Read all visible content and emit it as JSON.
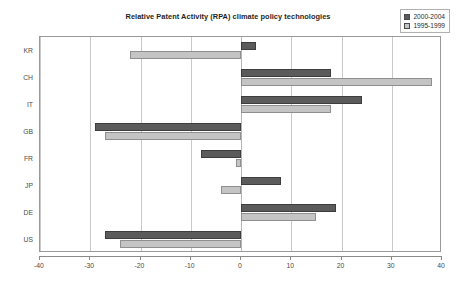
{
  "chart_data": {
    "type": "bar",
    "orientation": "horizontal",
    "title": "Relative Patent Activity (RPA) climate policy technologies",
    "xlabel": "",
    "ylabel": "",
    "categories": [
      "KR",
      "CH",
      "IT",
      "GB",
      "FR",
      "JP",
      "DE",
      "US"
    ],
    "series": [
      {
        "name": "2000-2004",
        "color": "#5b5b5b",
        "values": [
          3,
          18,
          24,
          -29,
          -8,
          8,
          19,
          -27
        ]
      },
      {
        "name": "1995-1999",
        "color": "#c4c4c4",
        "values": [
          -22,
          38,
          18,
          -27,
          -1,
          -4,
          15,
          -24
        ]
      }
    ],
    "xlim": [
      -40,
      40
    ],
    "xticks": [
      -40,
      -30,
      -20,
      -10,
      0,
      10,
      20,
      30,
      40
    ],
    "xtick_labels": [
      "-40",
      "-30",
      "-20",
      "-10",
      "0",
      "10",
      "20",
      "30",
      "40"
    ],
    "grid": "vertical",
    "legend_position": "top-right"
  },
  "legend": {
    "items": [
      {
        "label": "2000-2004",
        "color": "#5b5b5b"
      },
      {
        "label": "1995-1999",
        "color": "#c4c4c4"
      }
    ]
  }
}
